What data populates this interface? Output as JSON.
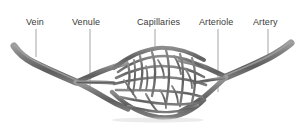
{
  "figure": {
    "background_color": "#ffffff",
    "vessel_color": "#6b6b6b",
    "vessel_shade_dark": "#4a4a4a",
    "vessel_shade_light": "#9a9a9a",
    "leader_line_color": "#9b9b9b",
    "label_color": "#3a3a3a"
  },
  "labels": [
    {
      "id": "vein",
      "text": "Vein",
      "leader_x": 36,
      "leader_y1": 29,
      "leader_y2": 57
    },
    {
      "id": "venule",
      "text": "Venule",
      "leader_x": 90,
      "leader_y1": 29,
      "leader_y2": 89
    },
    {
      "id": "capillaries",
      "text": "Capillaries",
      "leader_x": 155,
      "leader_y1": 29,
      "leader_y2": 50
    },
    {
      "id": "arteriole",
      "text": "Arteriole",
      "leader_x": 218,
      "leader_y1": 29,
      "leader_y2": 92
    },
    {
      "id": "artery",
      "text": "Artery",
      "leader_x": 268,
      "leader_y1": 29,
      "leader_y2": 56
    }
  ]
}
